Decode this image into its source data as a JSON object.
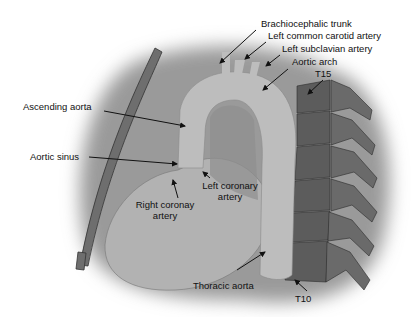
{
  "figure": {
    "type": "anatomical illustration",
    "colors": {
      "background": "#ffffff",
      "shadow": "#8f8f8f",
      "aorta": "#bcbcbc",
      "heart": "#b4b4b4",
      "rib": "#6e6e6e",
      "vertebra": "#5a5a5a",
      "label_text": "#111111",
      "arrow": "#111111"
    }
  },
  "labels": {
    "brachiocephalic_trunk": "Brachiocephalic trunk",
    "left_common_carotid": "Left common carotid artery",
    "left_subclavian": "Left subclavian artery",
    "aortic_arch": "Aortic arch",
    "t15": "T15",
    "ascending_aorta": "Ascending aorta",
    "aortic_sinus": "Aortic sinus",
    "left_coronary_line1": "Left coronary",
    "left_coronary_line2": "artery",
    "right_coronary_line1": "Right coronay",
    "right_coronary_line2": "artery",
    "thoracic_aorta": "Thoracic aorta",
    "t10": "T10"
  }
}
